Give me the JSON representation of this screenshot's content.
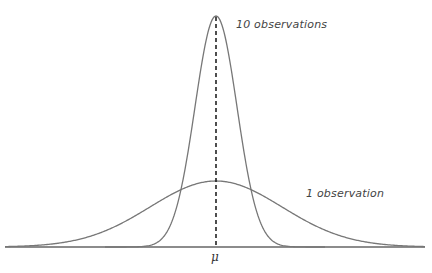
{
  "diagram": {
    "title": "",
    "labels": {
      "narrow_curve": "10 observations",
      "wide_curve": "1 observation",
      "mean_marker": "μ"
    },
    "colors": {
      "curve": "#777777",
      "axis": "#666666",
      "mean_line": "#222222",
      "text": "#444444"
    },
    "curves": [
      {
        "name": "10 observations",
        "type": "normal",
        "relative_sd": 0.316,
        "peak_y_px": 16
      },
      {
        "name": "1 observation",
        "type": "normal",
        "relative_sd": 1.0,
        "peak_y_px": 181
      }
    ],
    "mean_x_px": 216,
    "baseline_y_px": 247
  }
}
